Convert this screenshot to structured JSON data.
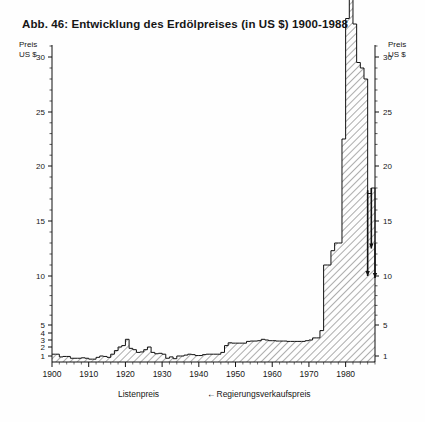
{
  "figure": {
    "title": "Abb. 46: Entwicklung des Erdölpreises (in US $) 1900-1988",
    "axis_caption_left_line1": "Preis",
    "axis_caption_left_line2": "US $",
    "axis_caption_right_line1": "Preis",
    "axis_caption_right_line2": "US $",
    "legend_listenpreis": "Listenpreis",
    "legend_regierung_arrow": "←",
    "legend_regierung": "Regierungsverkaufspreis",
    "fill_color": "#f2f2f2",
    "hatch_color": "#4a4a4a",
    "line_color": "#111111",
    "axis_color": "#111111",
    "gov_price_color": "#111111"
  },
  "chart_data": {
    "type": "area",
    "title": "Abb. 46: Entwicklung des Erdölpreises (in US $) 1900-1988",
    "subtitle": "",
    "xlabel": "",
    "ylabel": "Preis US $",
    "xlim": [
      1900,
      1988
    ],
    "ylim": [
      0.7,
      38
    ],
    "yscale": "log-like (compressed low range: 1,2,3,4,5 then 5-step to 30)",
    "grid": false,
    "legend_position": "below-axis",
    "legend": [
      "Listenpreis",
      "← Regierungsverkaufspreis"
    ],
    "xticks": [
      1900,
      1910,
      1920,
      1930,
      1940,
      1950,
      1960,
      1970,
      1980
    ],
    "xtick_labels": [
      "1900",
      "1910",
      "1920",
      "1930",
      "1940",
      "1950",
      "1960",
      "1970",
      "1980"
    ],
    "yticks_left": [
      1,
      2,
      3,
      4,
      5,
      10,
      15,
      20,
      25,
      30
    ],
    "ytick_labels_left": [
      "1",
      "2",
      "3",
      "4",
      "5",
      "10",
      "15",
      "20",
      "25",
      "30"
    ],
    "yticks_right": [
      1,
      5,
      10,
      15,
      20,
      25,
      30
    ],
    "ytick_labels_right": [
      "1",
      "5",
      "10",
      "15",
      "20",
      "25",
      "30"
    ],
    "series": [
      {
        "name": "Listenpreis",
        "style": "hatched-area",
        "x": [
          1900,
          1901,
          1902,
          1903,
          1904,
          1905,
          1906,
          1907,
          1908,
          1909,
          1910,
          1911,
          1912,
          1913,
          1914,
          1915,
          1916,
          1917,
          1918,
          1919,
          1920,
          1921,
          1922,
          1923,
          1924,
          1925,
          1926,
          1927,
          1928,
          1929,
          1930,
          1931,
          1932,
          1933,
          1934,
          1935,
          1936,
          1937,
          1938,
          1939,
          1940,
          1941,
          1942,
          1943,
          1944,
          1945,
          1946,
          1947,
          1948,
          1949,
          1950,
          1951,
          1952,
          1953,
          1954,
          1955,
          1956,
          1957,
          1958,
          1959,
          1960,
          1961,
          1962,
          1963,
          1964,
          1965,
          1966,
          1967,
          1968,
          1969,
          1970,
          1971,
          1972,
          1973,
          1974,
          1975,
          1976,
          1977,
          1978,
          1979,
          1980,
          1981,
          1982,
          1983,
          1984,
          1985,
          1986,
          1987,
          1988
        ],
        "values": [
          1.2,
          1.2,
          0.9,
          0.95,
          0.95,
          0.75,
          0.75,
          0.75,
          0.8,
          0.75,
          0.65,
          0.65,
          0.85,
          1.0,
          0.95,
          0.85,
          1.2,
          1.6,
          2.0,
          2.2,
          3.1,
          1.85,
          1.7,
          1.4,
          1.45,
          1.7,
          2.0,
          1.4,
          1.25,
          1.3,
          1.2,
          0.75,
          0.9,
          0.7,
          1.0,
          1.0,
          1.1,
          1.2,
          1.15,
          1.05,
          1.05,
          1.15,
          1.2,
          1.2,
          1.2,
          1.2,
          1.4,
          2.2,
          2.6,
          2.55,
          2.55,
          2.55,
          2.55,
          2.8,
          2.85,
          2.85,
          2.9,
          3.1,
          3.0,
          2.9,
          2.9,
          2.85,
          2.85,
          2.85,
          2.8,
          2.8,
          2.8,
          2.8,
          2.8,
          2.9,
          3.0,
          3.3,
          3.3,
          4.3,
          11.0,
          11.0,
          12.3,
          13.0,
          13.0,
          22.5,
          33.5,
          36.0,
          33.0,
          29.5,
          29.0,
          28.0,
          17.5,
          18.0,
          13.0
        ]
      },
      {
        "name": "Regierungsverkaufspreis",
        "style": "vertical-drop-markers",
        "annotations": [
          {
            "year": 1986,
            "from": 17.8,
            "to": 10.0
          },
          {
            "year": 1987,
            "from": 18.0,
            "to": 12.5
          },
          {
            "year": 1988,
            "from": 13.0,
            "to": 9.8
          }
        ]
      }
    ]
  }
}
